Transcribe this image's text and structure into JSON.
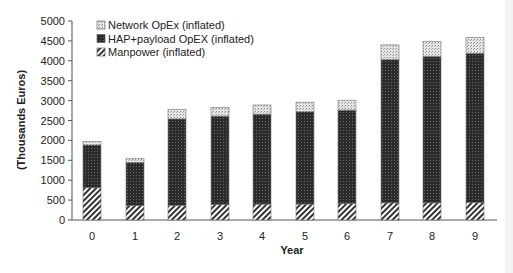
{
  "chart_data": {
    "type": "bar",
    "stacked": true,
    "title": "",
    "xlabel": "Year",
    "ylabel": "(Thousands Euros)",
    "ylim": [
      0,
      5000
    ],
    "yticks": [
      0,
      500,
      1000,
      1500,
      2000,
      2500,
      3000,
      3500,
      4000,
      4500,
      5000
    ],
    "categories": [
      "0",
      "1",
      "2",
      "3",
      "4",
      "5",
      "6",
      "7",
      "8",
      "9"
    ],
    "grid": false,
    "legend_position": "upper-left",
    "series": [
      {
        "name": "Manpower (inflated)",
        "pattern": "diagonal-hatch",
        "values": [
          810,
          360,
          370,
          390,
          400,
          400,
          410,
          430,
          430,
          440
        ]
      },
      {
        "name": "HAP+payload OpEX (inflated)",
        "pattern": "dense-dark-dots",
        "values": [
          1075,
          1090,
          2170,
          2220,
          2260,
          2320,
          2350,
          3600,
          3680,
          3750
        ]
      },
      {
        "name": "Network OpEx (inflated)",
        "pattern": "light-dots",
        "values": [
          85,
          90,
          240,
          220,
          230,
          240,
          250,
          370,
          370,
          400
        ]
      }
    ],
    "totals": [
      1970,
      1540,
      2780,
      2830,
      2890,
      2960,
      3010,
      4400,
      4480,
      4590
    ]
  },
  "legend": {
    "items": [
      {
        "label": "Network OpEx (inflated)",
        "pattern": "light-dots"
      },
      {
        "label": "HAP+payload OpEX (inflated)",
        "pattern": "dense-dark-dots"
      },
      {
        "label": "Manpower (inflated)",
        "pattern": "diagonal-hatch"
      }
    ]
  },
  "colors": {
    "axis": "#555555",
    "dark_fill": "#2b2b2b",
    "light_fill": "#d8d8d8",
    "hatch": "#333333"
  }
}
